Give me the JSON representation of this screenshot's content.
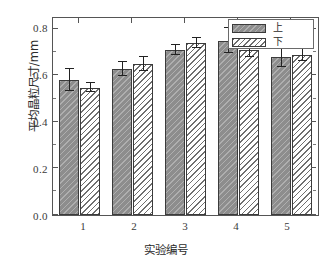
{
  "chart_data": {
    "type": "bar",
    "title": "",
    "xlabel": "实验编号",
    "ylabel": "平均晶粒尺寸/mm",
    "categories": [
      "1",
      "2",
      "3",
      "4",
      "5"
    ],
    "ylim": [
      0.0,
      0.85
    ],
    "yticks": [
      "0.0",
      "0.2",
      "0.4",
      "0.6",
      "0.8"
    ],
    "ytick_values": [
      0.0,
      0.2,
      0.4,
      0.6,
      0.8
    ],
    "grid": false,
    "legend_position": "top-right",
    "series": [
      {
        "name": "上",
        "values": [
          0.583,
          0.63,
          0.713,
          0.752,
          0.682
        ],
        "errors": [
          0.048,
          0.029,
          0.022,
          0.054,
          0.042
        ],
        "fill": "#8d8d8d",
        "pattern": "diagonal-hatch-on-gray"
      },
      {
        "name": "下",
        "values": [
          0.55,
          0.653,
          0.743,
          0.713,
          0.692
        ],
        "errors": [
          0.021,
          0.03,
          0.022,
          0.031,
          0.027
        ],
        "fill": "#ffffff",
        "pattern": "diagonal-hatch-on-white"
      }
    ]
  },
  "legend": {
    "items": [
      {
        "label": "上",
        "swatch": "gray-hatched-swatch"
      },
      {
        "label": "下",
        "swatch": "white-hatched-swatch"
      }
    ]
  },
  "axes": {
    "y_title": "平均晶粒尺寸/mm",
    "x_title": "实验编号"
  },
  "colors": {
    "frame": "#555555",
    "series_up": "#8d8d8d",
    "series_down": "#ffffff",
    "hatch": "#6f6f6f",
    "text": "#2b2b2b",
    "error_bar": "#222222"
  }
}
